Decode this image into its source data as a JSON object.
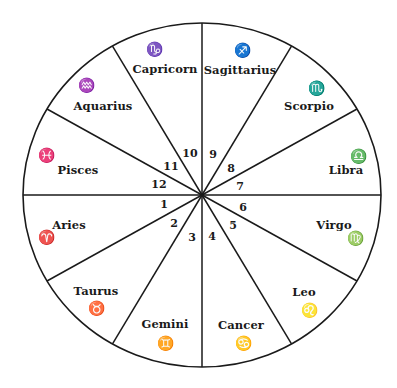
{
  "diagram": {
    "center": [
      202,
      195
    ],
    "radius_x": 179,
    "radius_y": 172,
    "line_color": "#1a1a1a",
    "divider_angles_deg": [
      0,
      30,
      60,
      90,
      120,
      150,
      180,
      210,
      240,
      270,
      300,
      330
    ],
    "signs": [
      {
        "name": "Capricorn",
        "glyph": "♑",
        "icon": "capricorn-icon",
        "name_pos": [
          165,
          69
        ],
        "glyph_pos": [
          154,
          49
        ]
      },
      {
        "name": "Sagittarius",
        "glyph": "♐",
        "icon": "sagittarius-icon",
        "name_pos": [
          240,
          70
        ],
        "glyph_pos": [
          242,
          50
        ]
      },
      {
        "name": "Scorpio",
        "glyph": "♏",
        "icon": "scorpio-icon",
        "name_pos": [
          309,
          106
        ],
        "glyph_pos": [
          316,
          88
        ]
      },
      {
        "name": "Libra",
        "glyph": "♎",
        "icon": "libra-icon",
        "name_pos": [
          346,
          170
        ],
        "glyph_pos": [
          358,
          156
        ]
      },
      {
        "name": "Virgo",
        "glyph": "♍",
        "icon": "virgo-icon",
        "name_pos": [
          334,
          225
        ],
        "glyph_pos": [
          355,
          238
        ]
      },
      {
        "name": "Leo",
        "glyph": "♌",
        "icon": "leo-icon",
        "name_pos": [
          304,
          292
        ],
        "glyph_pos": [
          309,
          310
        ]
      },
      {
        "name": "Cancer",
        "glyph": "♋",
        "icon": "cancer-icon",
        "name_pos": [
          241,
          325
        ],
        "glyph_pos": [
          243,
          343
        ]
      },
      {
        "name": "Gemini",
        "glyph": "♊",
        "icon": "gemini-icon",
        "name_pos": [
          165,
          324
        ],
        "glyph_pos": [
          165,
          343
        ]
      },
      {
        "name": "Taurus",
        "glyph": "♉",
        "icon": "taurus-icon",
        "name_pos": [
          96,
          291
        ],
        "glyph_pos": [
          96,
          308
        ]
      },
      {
        "name": "Aries",
        "glyph": "♈",
        "icon": "aries-icon",
        "name_pos": [
          69,
          225
        ],
        "glyph_pos": [
          46,
          237
        ]
      },
      {
        "name": "Pisces",
        "glyph": "♓",
        "icon": "pisces-icon",
        "name_pos": [
          78,
          170
        ],
        "glyph_pos": [
          46,
          155
        ]
      },
      {
        "name": "Aquarius",
        "glyph": "♒",
        "icon": "aquarius-icon",
        "name_pos": [
          103,
          106
        ],
        "glyph_pos": [
          86,
          85
        ]
      }
    ],
    "houses": [
      {
        "number": "1",
        "pos": [
          164,
          204
        ]
      },
      {
        "number": "2",
        "pos": [
          174,
          223
        ]
      },
      {
        "number": "3",
        "pos": [
          192,
          237
        ]
      },
      {
        "number": "4",
        "pos": [
          212,
          236
        ]
      },
      {
        "number": "5",
        "pos": [
          233,
          225
        ]
      },
      {
        "number": "6",
        "pos": [
          243,
          207
        ]
      },
      {
        "number": "7",
        "pos": [
          240,
          186
        ]
      },
      {
        "number": "8",
        "pos": [
          231,
          168
        ]
      },
      {
        "number": "9",
        "pos": [
          213,
          154
        ]
      },
      {
        "number": "10",
        "pos": [
          190,
          153
        ]
      },
      {
        "number": "11",
        "pos": [
          171,
          166
        ]
      },
      {
        "number": "12",
        "pos": [
          159,
          184
        ]
      }
    ]
  }
}
